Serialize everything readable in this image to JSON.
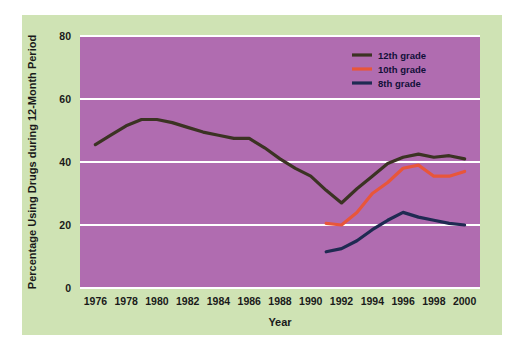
{
  "figure": {
    "outer_background": "#ffffff",
    "panel_background": "#cfe3b4",
    "plot_background": "#b濫"
  },
  "chart_data": {
    "type": "line",
    "title": "",
    "xlabel": "Year",
    "ylabel": "Percentage Using Drugs during 12-Month Period",
    "xlim": [
      1975,
      2001
    ],
    "ylim": [
      0,
      80
    ],
    "xticks": [
      1976,
      1978,
      1980,
      1982,
      1984,
      1986,
      1988,
      1990,
      1992,
      1994,
      1996,
      1998,
      2000
    ],
    "yticks": [
      0,
      20,
      40,
      60,
      80
    ],
    "grid": "horizontal",
    "legend_position": "top-right",
    "plot_area_color": "#b濫",
    "series": [
      {
        "name": "12th grade",
        "color": "#3b3323",
        "x": [
          1976,
          1977,
          1978,
          1979,
          1980,
          1981,
          1982,
          1983,
          1984,
          1985,
          1986,
          1987,
          1988,
          1989,
          1990,
          1991,
          1992,
          1993,
          1994,
          1995,
          1996,
          1997,
          1998,
          1999,
          2000
        ],
        "values": [
          45.5,
          48.5,
          51.5,
          53.5,
          53.5,
          52.5,
          51.0,
          49.5,
          48.5,
          47.5,
          47.5,
          44.5,
          41.0,
          38.0,
          35.5,
          31.0,
          27.0,
          31.5,
          35.5,
          39.5,
          41.5,
          42.5,
          41.5,
          42.0,
          41.0
        ]
      },
      {
        "name": "10th grade",
        "color": "#e8563a",
        "x": [
          1991,
          1992,
          1993,
          1994,
          1995,
          1996,
          1997,
          1998,
          1999,
          2000
        ],
        "values": [
          20.5,
          20.0,
          24.0,
          30.0,
          33.5,
          38.0,
          39.0,
          35.5,
          35.5,
          37.0
        ]
      },
      {
        "name": "8th grade",
        "color": "#1f2a52",
        "x": [
          1991,
          1992,
          1993,
          1994,
          1995,
          1996,
          1997,
          1998,
          1999,
          2000
        ],
        "values": [
          11.5,
          12.5,
          15.0,
          18.5,
          21.5,
          24.0,
          22.5,
          21.5,
          20.5,
          20.0
        ]
      }
    ]
  },
  "legend": {
    "entries": [
      {
        "label": "12th grade",
        "color": "#3b3323"
      },
      {
        "label": "10th grade",
        "color": "#e8563a"
      },
      {
        "label": "8th grade",
        "color": "#1f2a52"
      }
    ]
  }
}
